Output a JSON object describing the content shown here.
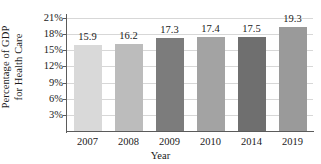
{
  "chart_data": {
    "type": "bar",
    "title": "",
    "xlabel": "Year",
    "ylabel_lines": [
      "Percentage of GDP",
      "for Health Care"
    ],
    "categories": [
      "2007",
      "2008",
      "2009",
      "2010",
      "2014",
      "2019"
    ],
    "values": [
      15.9,
      16.2,
      17.3,
      17.4,
      17.5,
      19.3
    ],
    "value_labels": [
      "15.9",
      "16.2",
      "17.3",
      "17.4",
      "17.5",
      "19.3"
    ],
    "bar_colors": [
      "#d9d9d9",
      "#bcbcbc",
      "#7c7c7c",
      "#a3a3a3",
      "#6f6f6f",
      "#9a9a9a"
    ],
    "ylim": [
      0,
      21
    ],
    "yticks": [
      3,
      6,
      9,
      12,
      15,
      18,
      21
    ],
    "ytick_labels": [
      "3%",
      "6%",
      "9%",
      "12%",
      "15%",
      "18%",
      "21%"
    ],
    "grid": true,
    "legend": "none",
    "axis_color": "#5b5b5b",
    "grid_color": "#d7d7d7"
  }
}
